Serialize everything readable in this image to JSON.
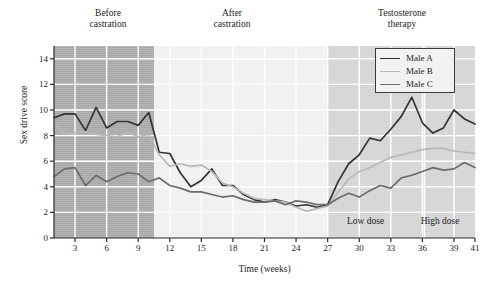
{
  "chart_data": {
    "type": "line",
    "title": "",
    "xlabel": "Time (weeks)",
    "ylabel": "Sex drive score",
    "xlim": [
      1,
      41
    ],
    "ylim": [
      0,
      15
    ],
    "grid": true,
    "legend_position": "top-right",
    "yticks": [
      0,
      2,
      4,
      6,
      8,
      10,
      12,
      14
    ],
    "xticks": [
      3,
      6,
      9,
      12,
      15,
      18,
      21,
      24,
      27,
      30,
      33,
      36,
      39,
      41
    ],
    "x": [
      1,
      2,
      3,
      4,
      5,
      6,
      7,
      8,
      9,
      10,
      11,
      12,
      13,
      14,
      15,
      16,
      17,
      18,
      19,
      20,
      21,
      22,
      23,
      24,
      25,
      26,
      27,
      28,
      29,
      30,
      31,
      32,
      33,
      34,
      35,
      36,
      37,
      38,
      39,
      40,
      41
    ],
    "series": [
      {
        "name": "Male A",
        "color": "#333333",
        "values": [
          9.4,
          9.7,
          9.7,
          8.4,
          10.2,
          8.6,
          9.1,
          9.1,
          8.8,
          9.8,
          6.7,
          6.6,
          5.1,
          4.0,
          4.5,
          5.4,
          4.1,
          4.1,
          3.4,
          3.0,
          2.8,
          3.0,
          2.8,
          2.5,
          2.6,
          2.4,
          2.6,
          4.4,
          5.8,
          6.5,
          7.8,
          7.6,
          8.5,
          9.5,
          11.0,
          9.0,
          8.2,
          8.6,
          10.0,
          9.3,
          8.9
        ]
      },
      {
        "name": "Male B",
        "color": "#b8b8b8",
        "values": [
          8.9,
          8.1,
          8.2,
          8.3,
          8.1,
          8.0,
          7.9,
          8.3,
          7.9,
          8.1,
          6.5,
          5.6,
          5.8,
          5.6,
          5.7,
          5.2,
          4.3,
          4.0,
          3.5,
          3.1,
          3.0,
          2.9,
          2.8,
          2.4,
          2.1,
          2.3,
          2.5,
          3.6,
          4.6,
          5.2,
          5.5,
          5.9,
          6.3,
          6.5,
          6.7,
          6.9,
          7.0,
          7.0,
          6.8,
          6.7,
          6.6
        ]
      },
      {
        "name": "Male C",
        "color": "#6b6b6b",
        "values": [
          4.8,
          5.4,
          5.5,
          4.1,
          4.9,
          4.4,
          4.8,
          5.1,
          5.0,
          4.4,
          4.7,
          4.1,
          3.9,
          3.6,
          3.6,
          3.4,
          3.2,
          3.3,
          3.0,
          2.8,
          2.8,
          2.9,
          2.6,
          2.9,
          2.8,
          2.6,
          2.6,
          3.1,
          3.5,
          3.2,
          3.7,
          4.1,
          3.9,
          4.7,
          4.9,
          5.2,
          5.5,
          5.3,
          5.4,
          5.9,
          5.5
        ]
      }
    ],
    "phases": [
      {
        "label": "Before\ncastration",
        "x_start": 1,
        "x_end": 10.5,
        "shade": "#a8a8a8"
      },
      {
        "label": "After\ncastration",
        "x_start": 10.5,
        "x_end": 27,
        "shade": "#f0f0f0"
      },
      {
        "label": "Testosterone\ntherapy",
        "x_start": 27,
        "x_end": 41,
        "shade": "#d4d4d4"
      }
    ],
    "annotations": [
      {
        "label": "Low dose",
        "x": 31.5,
        "y": 1.2
      },
      {
        "label": "High dose",
        "x": 38.5,
        "y": 1.2
      }
    ],
    "dose_divider_x": 36.2
  },
  "legend": {
    "entries": [
      {
        "label": "Male A"
      },
      {
        "label": "Male B"
      },
      {
        "label": "Male C"
      }
    ]
  }
}
